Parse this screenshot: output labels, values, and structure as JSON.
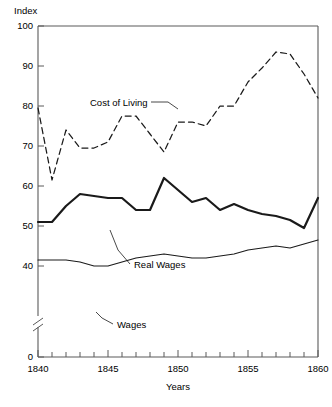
{
  "chart_data": {
    "type": "line",
    "title": "",
    "xlabel": "Years",
    "ylabel": "Index",
    "xlim": [
      1840,
      1860
    ],
    "ylim": [
      0,
      100
    ],
    "y_axis_break": true,
    "y_axis_break_note": "axis broken between 0 and ~38",
    "grid": false,
    "legend": "inline-annotations",
    "xticks": [
      1840,
      1845,
      1850,
      1855,
      1860
    ],
    "xtick_labels": [
      "1840",
      "1845",
      "1850",
      "1855",
      "1860"
    ],
    "x_minor_tick_interval": 1,
    "yticks": [
      0,
      40,
      50,
      60,
      70,
      80,
      90,
      100
    ],
    "ytick_labels": [
      "0",
      "40",
      "50",
      "60",
      "70",
      "80",
      "90",
      "100"
    ],
    "x": [
      1840,
      1841,
      1842,
      1843,
      1844,
      1845,
      1846,
      1847,
      1848,
      1849,
      1850,
      1851,
      1852,
      1853,
      1854,
      1855,
      1856,
      1857,
      1858,
      1859,
      1860
    ],
    "series": [
      {
        "name": "Cost of Living",
        "style": "dashed",
        "values": [
          79.5,
          61.5,
          74,
          69.5,
          69.5,
          71,
          77.5,
          77.5,
          73,
          68.5,
          76,
          76,
          75,
          80,
          80,
          86,
          89.5,
          93.5,
          93,
          88,
          82
        ]
      },
      {
        "name": "Real Wages",
        "style": "solid-thick",
        "values": [
          51,
          51,
          55,
          58,
          57.5,
          57,
          57,
          54,
          54,
          62,
          59,
          56,
          57,
          54,
          55.5,
          54,
          53,
          52.5,
          51.5,
          49.5,
          57
        ]
      },
      {
        "name": "Wages",
        "style": "solid-thin",
        "values": [
          41.5,
          41.5,
          41.5,
          41,
          40,
          40,
          41,
          42,
          42.5,
          43,
          42.5,
          42,
          42,
          42.5,
          43,
          44,
          44.5,
          45,
          44.5,
          45.5,
          46.5
        ]
      }
    ],
    "annotations": [
      {
        "label": "Cost of Living",
        "points_to_year": 1850,
        "points_to_value": 76
      },
      {
        "label": "Real Wages",
        "points_to_year": 1845,
        "points_to_value": 57
      },
      {
        "label": "Wages",
        "points_to_year": 1846,
        "points_to_value": 41
      }
    ]
  },
  "axis": {
    "y_title": "Index",
    "x_title": "Years"
  },
  "labels": {
    "y100": "100",
    "y90": "90",
    "y80": "80",
    "y70": "70",
    "y60": "60",
    "y50": "50",
    "y40": "40",
    "y0": "0",
    "x1840": "1840",
    "x1845": "1845",
    "x1850": "1850",
    "x1855": "1855",
    "x1860": "1860",
    "cost_of_living": "Cost of Living",
    "real_wages": "Real Wages",
    "wages": "Wages"
  },
  "colors": {
    "line": "#1a1a1a",
    "axis": "#5a5a5a",
    "background": "#ffffff"
  }
}
